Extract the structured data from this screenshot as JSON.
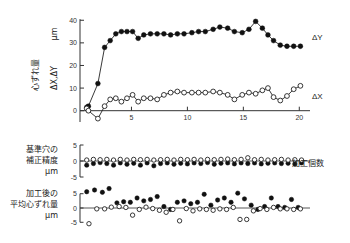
{
  "figure": {
    "title": "",
    "xlabel_right": "加工個数",
    "panels": [
      {
        "id": "top",
        "ylabel_line1": "心ずれ量",
        "ylabel_line2": "ΔX,ΔY",
        "ylabel_unit": "μm",
        "yticks": [
          "0",
          "10",
          "20",
          "30",
          "40"
        ],
        "xticks": [
          "5",
          "10",
          "15",
          "20"
        ],
        "series_labels": [
          "ΔY",
          "ΔX"
        ]
      },
      {
        "id": "middle",
        "ylabel_line1": "基準穴の",
        "ylabel_line2": "補正精度",
        "ylabel_unit": "μm",
        "yticks": [
          "5",
          "0",
          "-5"
        ]
      },
      {
        "id": "bottom",
        "ylabel_line1": "加工後の",
        "ylabel_line2": "平均心ずれ量",
        "ylabel_unit": "μm",
        "yticks": [
          "5",
          "0",
          "-5"
        ]
      }
    ]
  },
  "colors": {
    "axis": "#333333",
    "filled_marker": "#111111",
    "open_marker_stroke": "#222222",
    "open_marker_fill": "#ffffff",
    "background": "#ffffff"
  },
  "chart_data": [
    {
      "type": "line",
      "title": "心ずれ量 ΔX,ΔY μm",
      "xlabel": "加工個数",
      "ylabel": "心ずれ量 ΔX,ΔY (μm)",
      "xlim": [
        0.4,
        20.6
      ],
      "ylim": [
        -5,
        41
      ],
      "yticks": [
        0,
        10,
        20,
        30,
        40
      ],
      "xticks": [
        5,
        10,
        15,
        20
      ],
      "grid": false,
      "legend": "right-inline",
      "x": [
        1,
        1.4,
        2,
        2.6,
        3,
        3.5,
        4,
        4.5,
        5,
        5.5,
        6,
        6.5,
        7,
        7.5,
        8,
        8.5,
        9,
        9.5,
        10,
        10.5,
        11,
        11.5,
        12,
        12.5,
        13,
        13.5,
        14,
        14.5,
        15,
        15.5,
        16,
        16.5,
        17,
        17.5,
        18,
        18.5,
        19,
        19.5,
        20
      ],
      "series": [
        {
          "name": "ΔY",
          "marker": "filled-circle",
          "x": [
            1,
            1.15,
            2,
            2.6,
            3.1,
            3.6,
            4.1,
            4.6,
            5.1,
            5.6,
            6.1,
            6.7,
            7.3,
            7.9,
            8.5,
            9.1,
            9.7,
            10.4,
            11.0,
            11.6,
            12.3,
            12.9,
            13.6,
            14.2,
            14.9,
            15.5,
            16.1,
            16.7,
            17.2,
            17.7,
            18.3,
            18.9,
            19.5,
            20.1
          ],
          "values": [
            1.5,
            2.0,
            12.0,
            28.0,
            31.0,
            34.0,
            35.0,
            35.0,
            35.0,
            32.0,
            33.5,
            34.0,
            34.0,
            34.0,
            33.5,
            34.0,
            34.0,
            34.5,
            35.0,
            35.0,
            36.0,
            37.0,
            36.5,
            35.0,
            34.5,
            36.0,
            39.5,
            36.5,
            33.5,
            31.0,
            29.0,
            28.5,
            28.5,
            28.5
          ]
        },
        {
          "name": "ΔX",
          "marker": "open-circle",
          "x": [
            1,
            1.15,
            2,
            2.6,
            3.1,
            3.6,
            4.1,
            4.6,
            5.1,
            5.6,
            6.1,
            6.7,
            7.3,
            7.9,
            8.5,
            9.1,
            9.7,
            10.4,
            11.0,
            11.6,
            12.3,
            12.9,
            13.6,
            14.2,
            14.9,
            15.5,
            16.1,
            16.7,
            17.2,
            17.7,
            18.3,
            18.9,
            19.5,
            20.1
          ],
          "values": [
            1.0,
            0.0,
            -3.5,
            2.0,
            5.0,
            5.5,
            4.0,
            5.5,
            7.0,
            4.0,
            5.5,
            5.5,
            5.0,
            7.0,
            8.0,
            8.5,
            8.0,
            8.0,
            8.0,
            8.0,
            8.5,
            8.0,
            7.0,
            5.0,
            7.0,
            8.0,
            7.5,
            9.0,
            10.0,
            6.0,
            4.5,
            6.5,
            9.5,
            11.0
          ]
        }
      ]
    },
    {
      "type": "scatter",
      "title": "基準穴の補正精度 μm",
      "xlabel": "加工個数",
      "ylabel": "基準穴の補正精度 (μm)",
      "xlim": [
        0.4,
        20.6
      ],
      "ylim": [
        -5,
        5
      ],
      "yticks": [
        5,
        0,
        -5
      ],
      "grid": false,
      "series": [
        {
          "name": "filled",
          "marker": "filled-circle",
          "x": [
            1.0,
            1.6,
            2.2,
            2.8,
            3.4,
            4.0,
            4.6,
            5.2,
            5.8,
            6.4,
            7.0,
            7.6,
            8.2,
            8.8,
            9.4,
            10.0,
            10.6,
            11.2,
            11.8,
            12.4,
            13.0,
            13.6,
            14.2,
            14.8,
            15.4,
            16.0,
            16.6,
            17.2,
            17.8,
            18.4,
            19.0,
            19.6,
            20.2
          ],
          "values": [
            -1.3,
            -0.8,
            -0.5,
            -0.8,
            -1.3,
            -0.6,
            -1.0,
            -0.7,
            -1.3,
            -0.6,
            -1.5,
            -0.8,
            -0.6,
            -1.0,
            -0.7,
            -0.9,
            -0.6,
            -0.8,
            -0.5,
            -1.0,
            -0.7,
            -0.6,
            -0.9,
            -0.6,
            -0.8,
            -0.6,
            -0.9,
            -0.7,
            -0.6,
            -0.8,
            -0.7,
            -0.9,
            -0.6
          ]
        },
        {
          "name": "open",
          "marker": "open-circle",
          "x": [
            1.0,
            1.6,
            2.2,
            2.8,
            3.4,
            4.0,
            4.6,
            5.2,
            5.8,
            6.4,
            7.0,
            7.6,
            8.2,
            8.8,
            9.4,
            10.0,
            10.6,
            11.2,
            11.8,
            12.4,
            13.0,
            13.6,
            14.2,
            14.8,
            15.4,
            16.0,
            16.6,
            17.2,
            17.8,
            18.4,
            19.0,
            19.6,
            20.2
          ],
          "values": [
            0.3,
            0.5,
            0.4,
            0.5,
            0.3,
            0.5,
            0.3,
            0.5,
            0.4,
            0.5,
            0.3,
            0.4,
            0.5,
            0.3,
            0.5,
            0.4,
            0.5,
            0.3,
            0.5,
            0.4,
            0.5,
            0.6,
            0.4,
            0.5,
            1.0,
            0.4,
            0.5,
            0.3,
            0.4,
            0.5,
            0.3,
            0.4,
            0.3
          ]
        }
      ]
    },
    {
      "type": "scatter",
      "title": "加工後の平均心ずれ量 μm",
      "xlabel": "加工個数",
      "ylabel": "加工後の平均心ずれ量 (μm)",
      "xlim": [
        0.4,
        20.6
      ],
      "ylim": [
        -7,
        7
      ],
      "yticks": [
        5,
        0,
        -5
      ],
      "grid": false,
      "series": [
        {
          "name": "filled",
          "marker": "filled-circle",
          "x": [
            1.0,
            1.7,
            2.4,
            3.0,
            3.7,
            4.3,
            4.9,
            5.5,
            6.1,
            6.7,
            7.3,
            7.9,
            8.5,
            9.1,
            9.7,
            10.3,
            10.9,
            11.5,
            12.1,
            12.7,
            13.3,
            13.9,
            14.5,
            15.1,
            15.7,
            16.3,
            16.9,
            17.5,
            18.1,
            18.7,
            19.3,
            19.9
          ],
          "values": [
            5.7,
            6.3,
            5.5,
            6.8,
            1.8,
            2.2,
            2.0,
            3.5,
            2.5,
            3.0,
            4.0,
            0.5,
            -0.5,
            2.0,
            2.5,
            1.5,
            2.0,
            4.8,
            1.0,
            2.8,
            3.5,
            2.0,
            5.2,
            3.2,
            1.0,
            -0.5,
            0.5,
            3.5,
            0.5,
            0.2,
            3.0,
            0.2
          ]
        },
        {
          "name": "open",
          "marker": "open-circle",
          "x": [
            1.2,
            1.9,
            2.6,
            3.2,
            3.9,
            4.5,
            5.1,
            5.7,
            6.3,
            6.9,
            7.5,
            8.1,
            8.7,
            9.3,
            9.9,
            10.5,
            11.1,
            11.7,
            12.3,
            12.9,
            13.5,
            14.1,
            14.7,
            15.3,
            15.9,
            16.5,
            17.1,
            17.7,
            18.3,
            18.9,
            19.5,
            20.1
          ],
          "values": [
            -5.5,
            -0.3,
            -0.3,
            0.3,
            0.5,
            0.2,
            -2.5,
            -0.5,
            0.3,
            -0.2,
            -0.8,
            -1.5,
            -0.5,
            -4.5,
            -0.2,
            -1.0,
            -0.3,
            -0.5,
            -0.8,
            -0.3,
            -0.5,
            0.2,
            -4.0,
            -4.0,
            -1.0,
            -0.2,
            -0.5,
            0.2,
            -0.3,
            -0.3,
            -0.5,
            -0.3
          ]
        }
      ]
    }
  ]
}
